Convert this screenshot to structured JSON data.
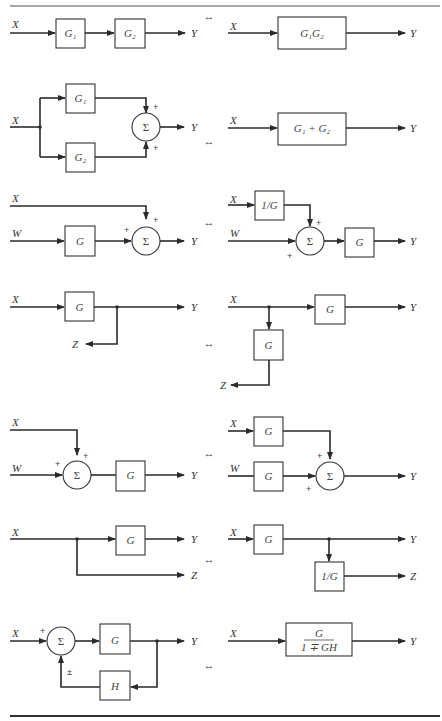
{
  "equivalence_symbol": "↔",
  "rows": [
    {
      "name": "cascade",
      "left": {
        "input": "X",
        "blocks": [
          "G₁",
          "G₂"
        ],
        "output": "Y"
      },
      "right": {
        "input": "X",
        "block": "G₁G₂",
        "output": "Y"
      }
    },
    {
      "name": "parallel",
      "left": {
        "input": "X",
        "blocks": [
          "G₁",
          "G₂"
        ],
        "sum": "Σ",
        "signs": [
          "+",
          "+"
        ],
        "output": "Y"
      },
      "right": {
        "input": "X",
        "block": "G₁ + G₂",
        "output": "Y"
      }
    },
    {
      "name": "move-summing-point-ahead",
      "left": {
        "inputs": [
          "X",
          "W"
        ],
        "block": "G",
        "sum": "Σ",
        "signs": [
          "+",
          "+"
        ],
        "output": "Y"
      },
      "right": {
        "inputs": [
          "X",
          "W"
        ],
        "blocks": [
          "1/G",
          "G"
        ],
        "sum": "Σ",
        "signs": [
          "+",
          "+"
        ],
        "output": "Y"
      }
    },
    {
      "name": "move-pickoff-point-ahead",
      "left": {
        "input": "X",
        "block": "G",
        "outputs": [
          "Y",
          "Z"
        ]
      },
      "right": {
        "input": "X",
        "blocks": [
          "G",
          "G"
        ],
        "outputs": [
          "Y",
          "Z"
        ]
      }
    },
    {
      "name": "move-summing-point-behind",
      "left": {
        "inputs": [
          "X",
          "W"
        ],
        "block": "G",
        "sum": "Σ",
        "signs": [
          "+",
          "+"
        ],
        "output": "Y"
      },
      "right": {
        "inputs": [
          "X",
          "W"
        ],
        "blocks": [
          "G",
          "G"
        ],
        "sum": "Σ",
        "signs": [
          "+",
          "+"
        ],
        "output": "Y"
      }
    },
    {
      "name": "move-pickoff-point-behind",
      "left": {
        "input": "X",
        "block": "G",
        "outputs": [
          "Y",
          "Z"
        ]
      },
      "right": {
        "input": "X",
        "blocks": [
          "G",
          "1/G"
        ],
        "outputs": [
          "Y",
          "Z"
        ]
      }
    },
    {
      "name": "feedback-loop",
      "left": {
        "input": "X",
        "blocks": [
          "G",
          "H"
        ],
        "sum": "Σ",
        "signs": [
          "+",
          "±"
        ],
        "output": "Y"
      },
      "right": {
        "input": "X",
        "block_numerator": "G",
        "block_denominator": "1 ∓ GH",
        "output": "Y"
      }
    }
  ]
}
